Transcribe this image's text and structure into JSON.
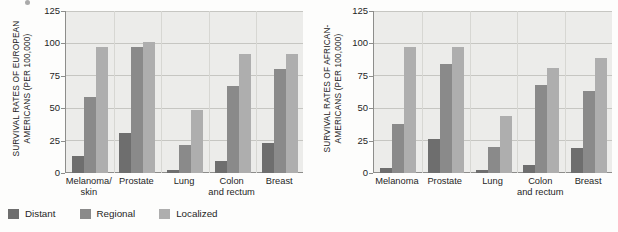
{
  "figure": {
    "background": "#fdfdfc",
    "plot_background": "#ececea"
  },
  "legend": {
    "position": "bottom-left",
    "items": [
      {
        "label": "Distant",
        "color": "#6e6e6e",
        "swatch_name": "legend-swatch-distant"
      },
      {
        "label": "Regional",
        "color": "#8a8a8a",
        "swatch_name": "legend-swatch-regional"
      },
      {
        "label": "Localized",
        "color": "#aeaeae",
        "swatch_name": "legend-swatch-localized"
      }
    ]
  },
  "panels": [
    {
      "id": "european-americans",
      "ylabel_line1": "SURVIVAL RATES OF EUROPEAN",
      "ylabel_line2": "AMERICANS (PER 100,000)",
      "yticks": [
        "0",
        "25",
        "50",
        "75",
        "100",
        "125"
      ],
      "categories": [
        {
          "line1": "Melanoma/",
          "line2": "skin"
        },
        {
          "line1": "Prostate",
          "line2": ""
        },
        {
          "line1": "Lung",
          "line2": ""
        },
        {
          "line1": "Colon",
          "line2": "and rectum"
        },
        {
          "line1": "Breast",
          "line2": ""
        }
      ]
    },
    {
      "id": "african-americans",
      "ylabel_line1": "SURVIVAL RATES OF AFRICAN-",
      "ylabel_line2": "AMERICANS (PER 100,000)",
      "yticks": [
        "0",
        "25",
        "50",
        "75",
        "100",
        "125"
      ],
      "categories": [
        {
          "line1": "Melanoma",
          "line2": ""
        },
        {
          "line1": "Prostate",
          "line2": ""
        },
        {
          "line1": "Lung",
          "line2": ""
        },
        {
          "line1": "Colon",
          "line2": "and rectum"
        },
        {
          "line1": "Breast",
          "line2": ""
        }
      ]
    }
  ],
  "chart_data": [
    {
      "type": "bar",
      "title": "",
      "xlabel": "",
      "ylabel": "SURVIVAL RATES OF EUROPEAN AMERICANS (PER 100,000)",
      "ylim": [
        0,
        125
      ],
      "yticks": [
        0,
        25,
        50,
        75,
        100,
        125
      ],
      "grid": true,
      "legend_position": "bottom-left",
      "categories": [
        "Melanoma/skin",
        "Prostate",
        "Lung",
        "Colon and rectum",
        "Breast"
      ],
      "series": [
        {
          "name": "Distant",
          "color": "#6e6e6e",
          "values": [
            13,
            31,
            2,
            9,
            23
          ]
        },
        {
          "name": "Regional",
          "color": "#8a8a8a",
          "values": [
            59,
            97,
            22,
            67,
            80
          ]
        },
        {
          "name": "Localized",
          "color": "#aeaeae",
          "values": [
            97,
            101,
            49,
            92,
            92
          ]
        }
      ]
    },
    {
      "type": "bar",
      "title": "",
      "xlabel": "",
      "ylabel": "SURVIVAL RATES OF AFRICAN-AMERICANS (PER 100,000)",
      "ylim": [
        0,
        125
      ],
      "yticks": [
        0,
        25,
        50,
        75,
        100,
        125
      ],
      "grid": true,
      "legend_position": "bottom-left",
      "categories": [
        "Melanoma",
        "Prostate",
        "Lung",
        "Colon and rectum",
        "Breast"
      ],
      "series": [
        {
          "name": "Distant",
          "color": "#6e6e6e",
          "values": [
            4,
            26,
            2,
            6,
            19
          ]
        },
        {
          "name": "Regional",
          "color": "#8a8a8a",
          "values": [
            38,
            84,
            20,
            68,
            63
          ]
        },
        {
          "name": "Localized",
          "color": "#aeaeae",
          "values": [
            97,
            97,
            44,
            81,
            89
          ]
        }
      ]
    }
  ]
}
